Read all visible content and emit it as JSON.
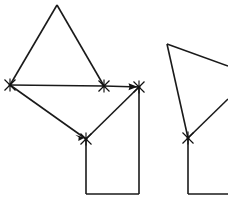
{
  "canvas": {
    "width": 228,
    "height": 205,
    "background": "#ffffff",
    "stroke_color": "#1a1a1a",
    "marker_color": "#111111",
    "arrow_color": "#111111",
    "line_width": 1.6
  },
  "figure": {
    "title": "",
    "shapes": [
      {
        "id": "left-shape",
        "name": "left-triangle-with-rectangle",
        "polygon_points": "57,5 104,86 139,87 139,194 86,194 86,139 10,85",
        "outline": [
          {
            "name": "triangle-left-edge",
            "x1": 57,
            "y1": 5,
            "x2": 10,
            "y2": 85
          },
          {
            "name": "triangle-right-edge",
            "x1": 57,
            "y1": 5,
            "x2": 104,
            "y2": 86
          },
          {
            "name": "triangle-base-edge",
            "x1": 10,
            "y1": 85,
            "x2": 104,
            "y2": 86
          },
          {
            "name": "base-extension-edge",
            "x1": 104,
            "y1": 86,
            "x2": 139,
            "y2": 87
          },
          {
            "name": "lower-left-diagonal",
            "x1": 10,
            "y1": 85,
            "x2": 86,
            "y2": 139
          },
          {
            "name": "lower-right-diagonal",
            "x1": 86,
            "y1": 139,
            "x2": 139,
            "y2": 87
          },
          {
            "name": "rect-left-edge",
            "x1": 86,
            "y1": 139,
            "x2": 86,
            "y2": 194
          },
          {
            "name": "rect-right-edge",
            "x1": 139,
            "y1": 87,
            "x2": 139,
            "y2": 194
          },
          {
            "name": "rect-bottom-edge",
            "x1": 86,
            "y1": 194,
            "x2": 139,
            "y2": 194
          }
        ],
        "vertices": [
          {
            "name": "vertex-left",
            "x": 10,
            "y": 85,
            "marker": "x-marker"
          },
          {
            "name": "vertex-mid",
            "x": 104,
            "y": 86,
            "marker": "x-marker"
          },
          {
            "name": "vertex-right",
            "x": 139,
            "y": 87,
            "marker": "x-marker"
          },
          {
            "name": "vertex-bottom",
            "x": 86,
            "y": 139,
            "marker": "x-marker"
          }
        ],
        "arrows": [
          {
            "name": "arrow-to-right-vertex",
            "x1": 10,
            "y1": 85,
            "x2": 136,
            "y2": 87,
            "direction": "right"
          },
          {
            "name": "arrow-to-bottom-vertex",
            "x1": 10,
            "y1": 85,
            "x2": 83,
            "y2": 137,
            "direction": "down-right"
          }
        ]
      },
      {
        "id": "right-shape",
        "name": "right-clipped-triangle-with-rectangle",
        "polygon_points": "167,44 228,66 228,194 188,194 188,138",
        "outline": [
          {
            "name": "top-edge",
            "x1": 167,
            "y1": 44,
            "x2": 228,
            "y2": 66
          },
          {
            "name": "left-diagonal",
            "x1": 167,
            "y1": 44,
            "x2": 188,
            "y2": 138
          },
          {
            "name": "right-diagonal",
            "x1": 188,
            "y1": 138,
            "x2": 228,
            "y2": 99
          },
          {
            "name": "rect-left-edge",
            "x1": 188,
            "y1": 138,
            "x2": 188,
            "y2": 194
          },
          {
            "name": "rect-bottom-edge",
            "x1": 188,
            "y1": 194,
            "x2": 228,
            "y2": 194
          }
        ],
        "vertices": [
          {
            "name": "vertex-bottom",
            "x": 188,
            "y": 138,
            "marker": "x-marker"
          }
        ],
        "arrows": []
      }
    ]
  }
}
